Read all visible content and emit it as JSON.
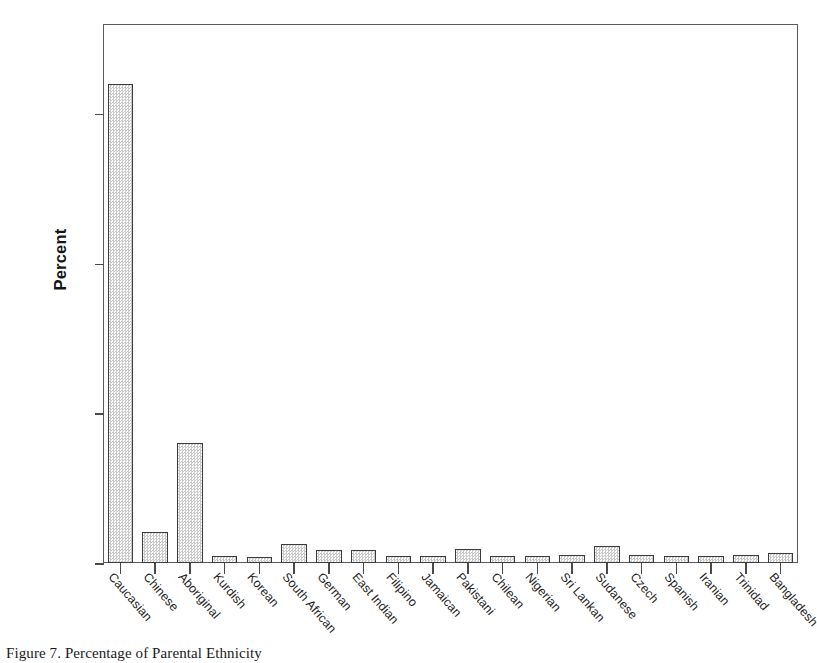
{
  "caption": "Figure 7. Percentage of Parental Ethnicity",
  "chart_data": {
    "type": "bar",
    "title": "",
    "xlabel": "",
    "ylabel": "Percent",
    "ylim": [
      0,
      72
    ],
    "grid": false,
    "legend": "none",
    "ytick_labels": [
      "0.0%",
      "20.0%",
      "40.0%",
      "60.0%"
    ],
    "ytick_values": [
      0,
      20,
      40,
      60
    ],
    "categories": [
      "Caucasian",
      "Chinese",
      "Aboriginal",
      "Kurdish",
      "Korean",
      "South African",
      "German",
      "East Indian",
      "Filipino",
      "Jamaican",
      "Pakistani",
      "Chilean",
      "Nigerian",
      "Sri Lankan",
      "Sudanese",
      "Czech",
      "Spanish",
      "Iranian",
      "Trinidad",
      "Bangladesh"
    ],
    "values": [
      64.0,
      4.2,
      16.0,
      0.9,
      0.8,
      2.5,
      1.8,
      1.8,
      1.0,
      1.0,
      1.9,
      1.0,
      1.0,
      1.1,
      2.3,
      1.1,
      1.0,
      1.0,
      1.1,
      1.4
    ],
    "bar_fill": "#f0f0f0",
    "bar_edge": "#3c3c3c",
    "axis_color": "#5a5a5a"
  }
}
